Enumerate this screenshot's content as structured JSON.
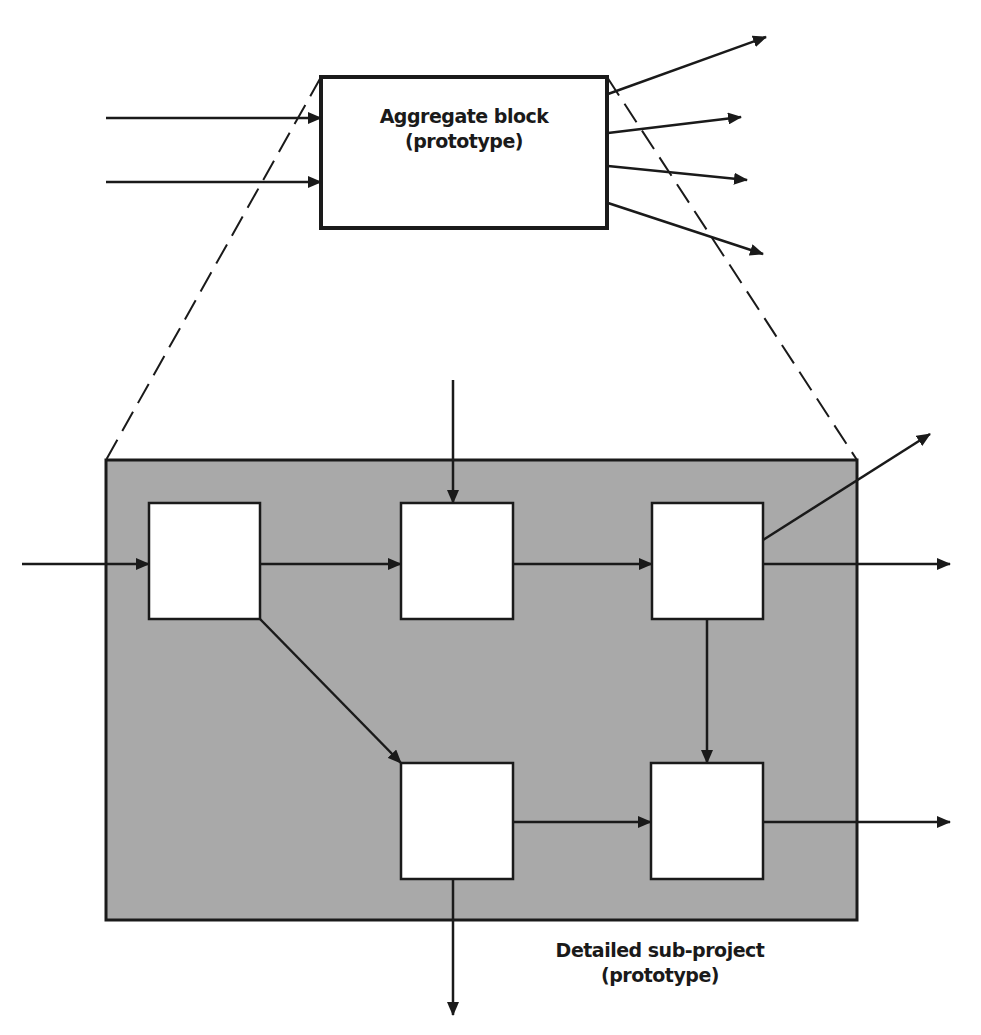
{
  "colors": {
    "stroke": "#1a1a1a",
    "panel_fill": "#a9a9a9",
    "box_fill": "#ffffff",
    "background": "#ffffff"
  },
  "aggregate": {
    "title": "Aggregate block",
    "subtitle": "(prototype)"
  },
  "subproject": {
    "title": "Detailed sub-project",
    "subtitle": "(prototype)"
  },
  "icons": {
    "arrowhead": "arrow-head-icon"
  }
}
